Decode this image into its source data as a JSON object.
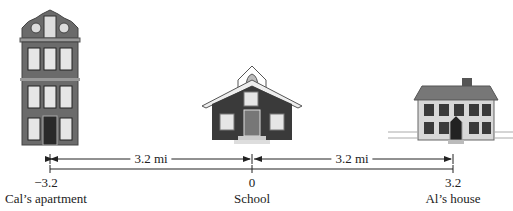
{
  "diagram": {
    "type": "number-line",
    "unit_label": "3.2 mi",
    "points": [
      {
        "id": "cal",
        "value": "−3.2",
        "label": "Cal’s apartment",
        "x": 50
      },
      {
        "id": "school",
        "value": "0",
        "label": "School",
        "x": 252
      },
      {
        "id": "al",
        "value": "3.2",
        "label": "Al’s house",
        "x": 453
      }
    ],
    "segments": [
      {
        "from": "cal",
        "to": "school",
        "label": "3.2 mi"
      },
      {
        "from": "school",
        "to": "al",
        "label": "3.2 mi"
      }
    ],
    "buildings": [
      {
        "id": "cal",
        "name": "apartment-building"
      },
      {
        "id": "school",
        "name": "schoolhouse"
      },
      {
        "id": "al",
        "name": "house"
      }
    ],
    "colors": {
      "building_gray": "#6b6b6b",
      "building_dark": "#3a3a3a",
      "window": "#e6e6e6",
      "line": "#222222"
    }
  }
}
